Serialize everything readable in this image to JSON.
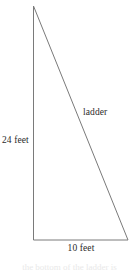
{
  "figure": {
    "type": "right-triangle-geometry-diagram",
    "background_color": "#ffffff",
    "stroke_color": "#7a7a7a",
    "text_color": "#2b2b2b",
    "labels": {
      "vertical_leg": "24 feet",
      "hypotenuse": "ladder",
      "base": "10 feet"
    },
    "geometry": {
      "apex": {
        "x": 33.5,
        "y": 6
      },
      "bottom_left": {
        "x": 33.5,
        "y": 240
      },
      "bottom_right": {
        "x": 128,
        "y": 240
      },
      "vertical_leg_length_feet": 24,
      "base_length_feet": 10,
      "stroke_width": 1
    },
    "clipped_caption": "the bottom of the ladder is"
  }
}
